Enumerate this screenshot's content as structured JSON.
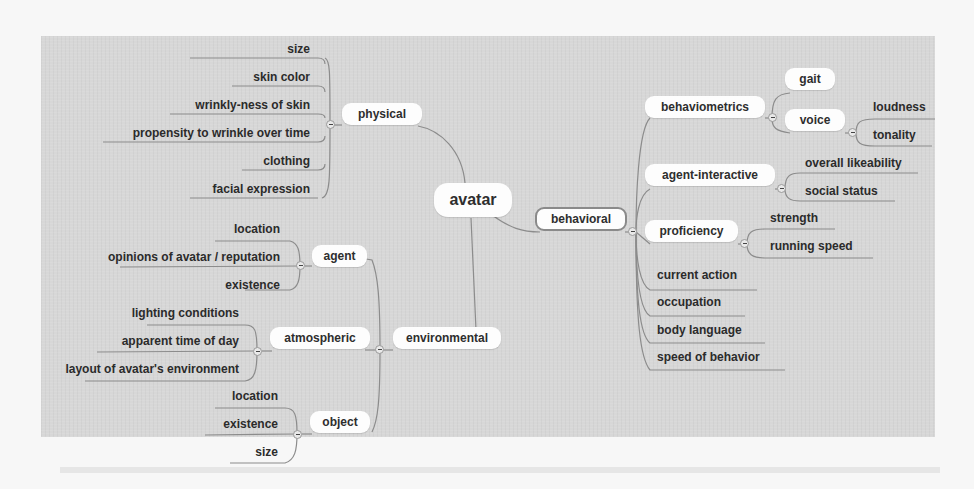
{
  "mindmap": {
    "root": "avatar",
    "branches": {
      "physical": {
        "label": "physical",
        "children": [
          "size",
          "skin color",
          "wrinkly-ness of skin",
          "propensity to wrinkle over time",
          "clothing",
          "facial expression"
        ]
      },
      "behavioral": {
        "label": "behavioral",
        "behaviometrics": {
          "label": "behaviometrics",
          "gait": "gait",
          "voice": {
            "label": "voice",
            "children": [
              "loudness",
              "tonality"
            ]
          }
        },
        "agent_interactive": {
          "label": "agent-interactive",
          "children": [
            "overall likeability",
            "social status"
          ]
        },
        "proficiency": {
          "label": "proficiency",
          "children": [
            "strength",
            "running speed"
          ]
        },
        "leaves": [
          "current action",
          "occupation",
          "body language",
          "speed of behavior"
        ]
      },
      "environmental": {
        "label": "environmental",
        "agent": {
          "label": "agent",
          "children": [
            "location",
            "opinions of avatar / reputation",
            "existence"
          ]
        },
        "atmospheric": {
          "label": "atmospheric",
          "children": [
            "lighting conditions",
            "apparent time of day",
            "layout of avatar's environment"
          ]
        },
        "object": {
          "label": "object",
          "children": [
            "location",
            "existence",
            "size"
          ]
        }
      }
    }
  },
  "colors": {
    "panel": "#d7d7d7",
    "node_fill": "#fdfdfd",
    "edge": "#8c8c8c",
    "text": "#2e2e2e"
  }
}
